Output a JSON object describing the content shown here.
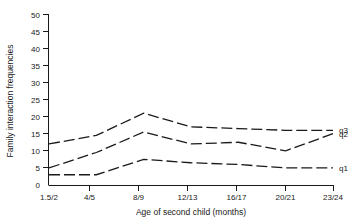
{
  "chart_data": {
    "type": "line",
    "title": "",
    "xlabel": "Age of second child (months)",
    "ylabel": "Family interaction frequencies",
    "categories": [
      "1.5/2",
      "4/5",
      "8/9",
      "12/13",
      "16/17",
      "20/21",
      "23/24"
    ],
    "xticklabels": [
      "1.5/2",
      "4/5",
      "8/9",
      "12/13",
      "16/17",
      "20/21",
      "23/24"
    ],
    "yticklabels": [
      "0",
      "5",
      "10",
      "15",
      "20",
      "25",
      "30",
      "35",
      "40",
      "45",
      "50"
    ],
    "yticks": [
      0,
      5,
      10,
      15,
      20,
      25,
      30,
      35,
      40,
      45,
      50
    ],
    "ylim": [
      0,
      50
    ],
    "grid": false,
    "legend_position": "right-inline",
    "linestyle": "dashed",
    "series": [
      {
        "name": "q3",
        "label": "q3",
        "values": [
          12.0,
          14.5,
          21.0,
          17.0,
          16.5,
          16.0,
          16.0
        ],
        "color": "#1a1a1a"
      },
      {
        "name": "q2",
        "label": "q2",
        "values": [
          5.0,
          9.5,
          15.5,
          12.0,
          12.5,
          10.0,
          15.0
        ],
        "color": "#1a1a1a"
      },
      {
        "name": "q1",
        "label": "q1",
        "values": [
          3.0,
          3.0,
          7.5,
          6.5,
          6.0,
          5.0,
          5.0
        ],
        "color": "#1a1a1a"
      }
    ]
  },
  "axes": {
    "y_title": "Family interaction frequencies",
    "x_title": "Age of second child (months)",
    "y_ticks": [
      {
        "label": "50",
        "value": 50
      },
      {
        "label": "45",
        "value": 45
      },
      {
        "label": "40",
        "value": 40
      },
      {
        "label": "35",
        "value": 35
      },
      {
        "label": "30",
        "value": 30
      },
      {
        "label": "25",
        "value": 25
      },
      {
        "label": "20",
        "value": 20
      },
      {
        "label": "15",
        "value": 15
      },
      {
        "label": "10",
        "value": 10
      },
      {
        "label": "5",
        "value": 5
      },
      {
        "label": "0",
        "value": 0
      }
    ],
    "x_ticks": [
      {
        "label": "1.5/2"
      },
      {
        "label": "4/5"
      },
      {
        "label": "8/9"
      },
      {
        "label": "12/13"
      },
      {
        "label": "16/17"
      },
      {
        "label": "20/21"
      },
      {
        "label": "23/24"
      }
    ]
  },
  "series_labels": [
    {
      "label": "q3"
    },
    {
      "label": "q2"
    },
    {
      "label": "q1"
    }
  ],
  "colors": {
    "line": "#1a1a1a",
    "axis": "#1a1a1a",
    "background": "#ffffff"
  }
}
